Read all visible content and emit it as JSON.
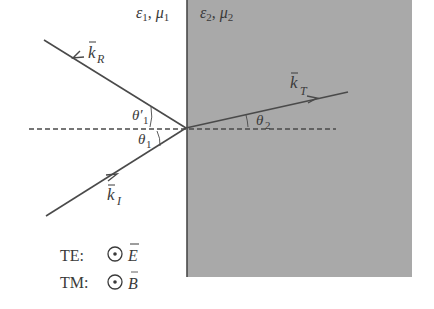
{
  "media": {
    "left": {
      "eps": "ε",
      "eps_sub": "1",
      "mu": "μ",
      "mu_sub": "1",
      "sep": ", "
    },
    "right": {
      "eps": "ε",
      "eps_sub": "2",
      "mu": "μ",
      "mu_sub": "2",
      "sep": ", "
    }
  },
  "waves": {
    "incident": {
      "symbol": "k",
      "sub": "I",
      "vector_arrow": "→"
    },
    "reflected": {
      "symbol": "k",
      "sub": "R",
      "vector_arrow": "→"
    },
    "transmitted": {
      "symbol": "k",
      "sub": "T",
      "vector_arrow": "→"
    }
  },
  "angles": {
    "incidence": {
      "symbol": "θ",
      "sub": "1"
    },
    "reflection": {
      "symbol": "θ′",
      "sub": "1"
    },
    "transmission": {
      "symbol": "θ",
      "sub": "2"
    }
  },
  "legend": [
    {
      "mode": "TE:",
      "icon": "out-of-page-dot-icon",
      "field": "E"
    },
    {
      "mode": "TM:",
      "icon": "out-of-page-dot-icon",
      "field": "B"
    }
  ],
  "colors": {
    "medium2_fill": "#a9a9a9",
    "line": "#4a4a4a",
    "text": "#3a3a3a",
    "background": "#ffffff"
  }
}
